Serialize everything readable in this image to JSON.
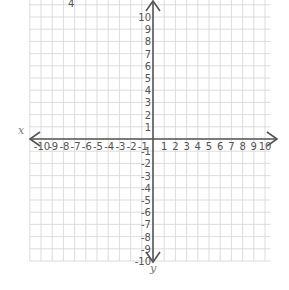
{
  "diagram": {
    "type": "coordinate-plane",
    "x_axis": {
      "label": "x",
      "min": -10,
      "max": 10,
      "tick_labels": [
        "-10",
        "-9",
        "-8",
        "-7",
        "-6",
        "-5",
        "-4",
        "-3",
        "-2",
        "-1",
        "1",
        "2",
        "3",
        "4",
        "5",
        "6",
        "7",
        "8",
        "9",
        "10"
      ]
    },
    "y_axis": {
      "label": "y",
      "min": -10,
      "max": 10,
      "tick_labels": [
        "10",
        "9",
        "8",
        "7",
        "6",
        "5",
        "4",
        "3",
        "2",
        "1",
        "-1",
        "-2",
        "-3",
        "-4",
        "-5",
        "-6",
        "-7",
        "-8",
        "-9",
        "-10"
      ]
    },
    "top_fragment_text": "4",
    "colors": {
      "axis": "#555555",
      "grid": "#d4d4d4",
      "background": "#ffffff"
    }
  }
}
